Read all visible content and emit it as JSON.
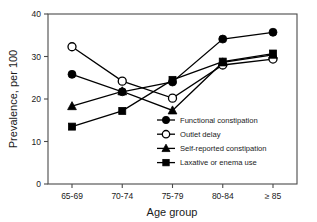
{
  "chart_data": {
    "type": "line",
    "title": "",
    "subtitle": "",
    "xlabel": "Age group",
    "ylabel": "Prevalence, per 100",
    "categories": [
      "65-69",
      "70-74",
      "75-79",
      "80-84",
      "≥ 85"
    ],
    "ylim": [
      0,
      40
    ],
    "yticks": [
      0,
      10,
      20,
      30,
      40
    ],
    "ytick_labels": [
      "0",
      "10",
      "20",
      "30",
      "40"
    ],
    "grid": false,
    "legend_position": "inside-lower-right",
    "series": [
      {
        "name": "Functional constipation",
        "marker": "filled-circle",
        "values": [
          25.8,
          21.7,
          24.0,
          34.1,
          35.7
        ]
      },
      {
        "name": "Outlet delay",
        "marker": "open-circle",
        "values": [
          32.3,
          24.2,
          20.2,
          28.0,
          29.4
        ]
      },
      {
        "name": "Self-reported constipation",
        "marker": "filled-triangle",
        "values": [
          18.3,
          21.8,
          17.3,
          28.6,
          30.4
        ]
      },
      {
        "name": "Laxative or enema use",
        "marker": "filled-square",
        "values": [
          13.5,
          17.2,
          24.5,
          28.8,
          30.7
        ]
      }
    ]
  },
  "axes": {
    "y_title": "Prevalence, per 100",
    "x_title": "Age group"
  },
  "legend": {
    "items": [
      {
        "label": "Functional constipation",
        "marker": "filled-circle"
      },
      {
        "label": "Outlet delay",
        "marker": "open-circle"
      },
      {
        "label": "Self-reported constipation",
        "marker": "filled-triangle"
      },
      {
        "label": "Laxative or enema use",
        "marker": "filled-square"
      }
    ]
  }
}
